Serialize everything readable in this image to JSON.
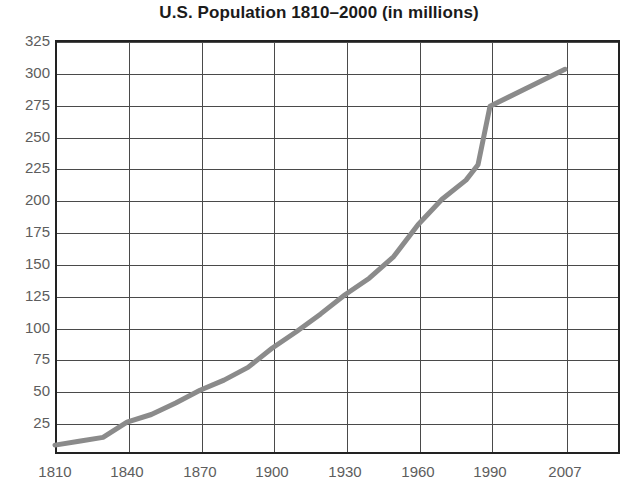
{
  "chart_data": {
    "type": "line",
    "title": "U.S. Population 1810–2000 (in millions)",
    "xlabel": "",
    "ylabel": "",
    "grid": true,
    "legend": "none",
    "xlim": [
      1810,
      2007
    ],
    "ylim": [
      0,
      325
    ],
    "x_ticks": [
      1810,
      1840,
      1870,
      1900,
      1930,
      1960,
      1990,
      2007
    ],
    "x_tick_labels": [
      "1810",
      "1840",
      "1870",
      "1900",
      "1930",
      "1960",
      "1990",
      "2007"
    ],
    "y_ticks": [
      25,
      50,
      75,
      100,
      125,
      150,
      175,
      200,
      225,
      250,
      275,
      300,
      325
    ],
    "y_tick_labels": [
      "25",
      "50",
      "75",
      "100",
      "125",
      "150",
      "175",
      "200",
      "225",
      "250",
      "275",
      "300",
      "325"
    ],
    "series": [
      {
        "name": "U.S. Population",
        "color": "#8b8b8b",
        "x": [
          1810,
          1820,
          1830,
          1840,
          1850,
          1860,
          1870,
          1880,
          1890,
          1900,
          1910,
          1920,
          1930,
          1940,
          1950,
          1960,
          1970,
          1980,
          1985,
          1990,
          2000,
          2007
        ],
        "values": [
          7,
          10,
          13,
          25,
          31,
          40,
          50,
          58,
          68,
          83,
          96,
          110,
          125,
          138,
          155,
          180,
          200,
          215,
          227,
          273,
          290,
          302
        ]
      }
    ],
    "line_color": "#8b8b8b",
    "line_width": 5,
    "axis_color": "#222222",
    "grid_color": "#4a4a4a",
    "label_color": "#5d5d5d",
    "background": "#ffffff"
  }
}
